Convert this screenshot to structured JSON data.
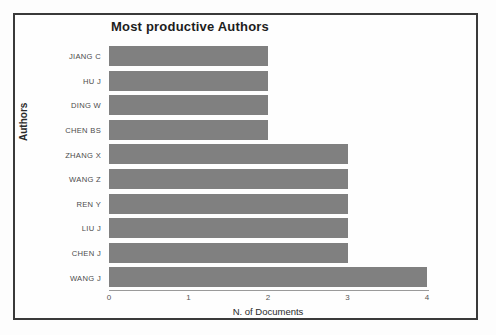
{
  "chart_data": {
    "type": "bar",
    "orientation": "horizontal",
    "title": "Most productive Authors",
    "xlabel": "N. of Documents",
    "ylabel": "Authors",
    "categories": [
      "JIANG C",
      "HU J",
      "DING W",
      "CHEN BS",
      "ZHANG X",
      "WANG Z",
      "REN Y",
      "LIU J",
      "CHEN J",
      "WANG J"
    ],
    "values": [
      2,
      2,
      2,
      2,
      3,
      3,
      3,
      3,
      3,
      4
    ],
    "xlim": [
      0,
      4
    ],
    "xticks": [
      "0",
      "1",
      "2",
      "3",
      "4"
    ],
    "grid": false,
    "legend": false,
    "bar_color": "#808080",
    "frame_color": "#3a3a3a",
    "background": "#ffffff"
  }
}
